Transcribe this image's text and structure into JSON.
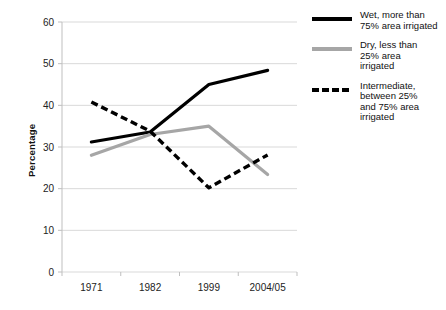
{
  "chart_data": {
    "type": "line",
    "title": "",
    "subtitle": "",
    "xlabel": "",
    "ylabel": "Percentage",
    "categories": [
      "1971",
      "1982",
      "1999",
      "2004/05"
    ],
    "ylim": [
      0,
      60
    ],
    "yticks": [
      0,
      10,
      20,
      30,
      40,
      50,
      60
    ],
    "ytick_labels": [
      "0",
      "10",
      "20",
      "30",
      "40",
      "50",
      "60"
    ],
    "grid": "horizontal",
    "legend_position": "right",
    "series": [
      {
        "name": "Wet, more than 75% area irrigated",
        "values": [
          31.2,
          33.6,
          45.0,
          48.4
        ],
        "color": "#000000",
        "style": "solid",
        "legend_lines": [
          "Wet, more than",
          "75% area irrigated"
        ]
      },
      {
        "name": "Dry, less than 25% area irrigated",
        "values": [
          28.0,
          33.0,
          35.0,
          23.4
        ],
        "color": "#a6a6a6",
        "style": "solid",
        "legend_lines": [
          "Dry, less than",
          "25% area",
          "irrigated"
        ]
      },
      {
        "name": "Intermediate, between 25% and 75% area irrigated",
        "values": [
          40.8,
          33.8,
          20.2,
          28.1
        ],
        "color": "#000000",
        "style": "dashed",
        "legend_lines": [
          "Intermediate,",
          "between 25%",
          "and 75% area",
          "irrigated"
        ]
      }
    ]
  },
  "axes": {
    "y_title": "Percentage"
  },
  "legend": {
    "entries": [
      {
        "swatch": "solid-black",
        "line1": "Wet, more than",
        "line2": "75% area irrigated",
        "line3": "",
        "line4": ""
      },
      {
        "swatch": "solid-gray",
        "line1": "Dry, less than",
        "line2": "25% area",
        "line3": "irrigated",
        "line4": ""
      },
      {
        "swatch": "dashed-black",
        "line1": "Intermediate,",
        "line2": "between 25%",
        "line3": "and 75% area",
        "line4": "irrigated"
      }
    ]
  },
  "colors": {
    "wet_line": "#000000",
    "dry_line": "#a6a6a6",
    "intermediate_line": "#000000",
    "gridline": "#d9d9d9",
    "axis": "#bfbfbf",
    "text": "#222222"
  }
}
